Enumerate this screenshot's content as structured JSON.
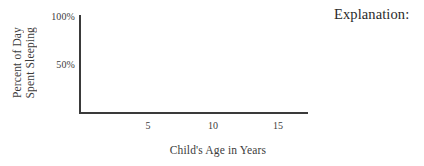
{
  "page": {
    "background_color": "#ffffff",
    "axis_color": "#3a3a3a",
    "text_color": "#3c3c3c"
  },
  "explanation": {
    "heading": "Explanation:"
  },
  "chart_data": {
    "type": "line",
    "title": "",
    "subtitle": "",
    "xlabel": "Child's Age in Years",
    "ylabel_line1": "Percent of Day",
    "ylabel_line2": "Spent Sleeping",
    "x": [],
    "series": [],
    "xlim": [
      0,
      17.5
    ],
    "ylim": [
      0,
      100
    ],
    "xticks": [
      5,
      10,
      15
    ],
    "xtick_labels": [
      "5",
      "10",
      "15"
    ],
    "yticks": [
      50,
      100
    ],
    "ytick_labels": [
      "50%",
      "100%"
    ],
    "grid": false,
    "legend": false,
    "legend_position": "none",
    "annotations": [],
    "note": "Empty axes: no data plotted, blank grid for student response"
  }
}
